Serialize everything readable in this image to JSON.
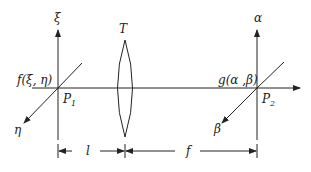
{
  "diagram": {
    "labels": {
      "xi": "ξ",
      "eta": "η",
      "alpha": "α",
      "beta": "β",
      "lens": "T",
      "input_function": "f(ξ, η)",
      "output_function": "g(α ,β)",
      "plane1": "P",
      "plane1_sub": "1",
      "plane2": "P",
      "plane2_sub": "2",
      "dist_l": "l",
      "dist_f": "f"
    },
    "colors": {
      "stroke": "#222222",
      "background": "#ffffff"
    }
  }
}
